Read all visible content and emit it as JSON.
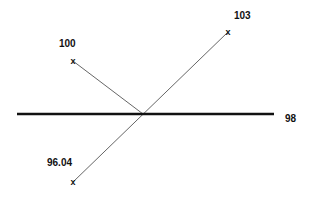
{
  "diagram": {
    "type": "nomogram-lines",
    "colors": {
      "background": "#ffffff",
      "thick_line": "#111111",
      "thin_line": "#555555",
      "text": "#111111"
    },
    "horizontal_line": {
      "label": "98",
      "x1": 17,
      "y1": 114,
      "x2": 274,
      "y2": 114,
      "label_x": 285,
      "label_y": 122
    },
    "intersection": {
      "x": 143,
      "y": 114
    },
    "points": [
      {
        "id": "p100",
        "label": "100",
        "marker": "x",
        "x": 73,
        "y": 61,
        "label_x": 59,
        "label_y": 47
      },
      {
        "id": "p103",
        "label": "103",
        "marker": "x",
        "x": 228,
        "y": 32,
        "label_x": 234,
        "label_y": 19
      },
      {
        "id": "p9604",
        "label": "96.04",
        "marker": "x",
        "x": 73,
        "y": 182,
        "label_x": 47,
        "label_y": 166
      }
    ],
    "segments": [
      {
        "id": "seg-100-to-center",
        "from": "p100",
        "to": "center"
      },
      {
        "id": "seg-9604-to-103",
        "from": "p9604",
        "to": "p103"
      }
    ]
  }
}
